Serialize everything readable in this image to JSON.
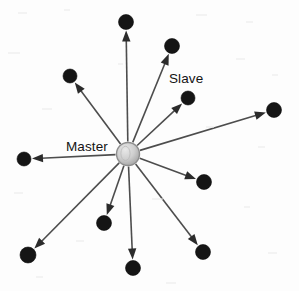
{
  "figure": {
    "name": "master-slave-star-topology",
    "width": 299,
    "height": 291,
    "background_color": "#fdfdfd"
  },
  "labels": {
    "master": "Master",
    "slave": "Slave"
  },
  "colors": {
    "edge": "#4d4d4d",
    "arrow_head": "#2b2b2b",
    "slave_fill": "#151515",
    "master_fill_light": "#dcdcdc",
    "master_fill_dark": "#a8a8a8",
    "master_stroke": "#8d8d8d",
    "label_text": "#141414"
  },
  "master_node": {
    "id": "master",
    "label": "Master",
    "cx": 128,
    "cy": 154,
    "r": 11.5
  },
  "label_positions": {
    "master": {
      "x": 66,
      "y": 151,
      "anchor": "start"
    },
    "slave": {
      "x": 169,
      "y": 83,
      "anchor": "start"
    }
  },
  "slave_nodes": [
    {
      "id": "slave-1",
      "cx": 126,
      "cy": 22,
      "r": 7.5,
      "angle_deg": 269
    },
    {
      "id": "slave-2",
      "cx": 172,
      "cy": 46,
      "r": 7.5,
      "angle_deg": 295
    },
    {
      "id": "slave-3",
      "cx": 70,
      "cy": 76,
      "r": 7.0,
      "angle_deg": 217
    },
    {
      "id": "slave-4",
      "cx": 188,
      "cy": 98,
      "r": 7.0,
      "angle_deg": 318
    },
    {
      "id": "slave-5",
      "cx": 274,
      "cy": 110,
      "r": 7.5,
      "angle_deg": 345
    },
    {
      "id": "slave-6",
      "cx": 24,
      "cy": 159,
      "r": 7.0,
      "angle_deg": 182
    },
    {
      "id": "slave-7",
      "cx": 204,
      "cy": 182,
      "r": 7.5,
      "angle_deg": 20
    },
    {
      "id": "slave-8",
      "cx": 104,
      "cy": 223,
      "r": 7.5,
      "angle_deg": 108
    },
    {
      "id": "slave-9",
      "cx": 28,
      "cy": 255,
      "r": 8.0,
      "angle_deg": 134
    },
    {
      "id": "slave-10",
      "cx": 133,
      "cy": 268,
      "r": 7.5,
      "angle_deg": 92
    },
    {
      "id": "slave-11",
      "cx": 203,
      "cy": 252,
      "r": 7.5,
      "angle_deg": 52
    }
  ],
  "edges": [
    {
      "from": "master",
      "to": "slave-1",
      "directed": true
    },
    {
      "from": "master",
      "to": "slave-2",
      "directed": true
    },
    {
      "from": "master",
      "to": "slave-3",
      "directed": true
    },
    {
      "from": "master",
      "to": "slave-4",
      "directed": true
    },
    {
      "from": "master",
      "to": "slave-5",
      "directed": true
    },
    {
      "from": "master",
      "to": "slave-6",
      "directed": true
    },
    {
      "from": "master",
      "to": "slave-7",
      "directed": true
    },
    {
      "from": "master",
      "to": "slave-8",
      "directed": true
    },
    {
      "from": "master",
      "to": "slave-9",
      "directed": true
    },
    {
      "from": "master",
      "to": "slave-10",
      "directed": true
    },
    {
      "from": "master",
      "to": "slave-11",
      "directed": true
    }
  ],
  "geometry": {
    "arrow_length": 11,
    "arrow_half_width": 4.2,
    "edge_stroke_width": 1.6,
    "gap_before_node": 1.0,
    "gap_after_hub": 1.0
  },
  "scan_specks": [
    {
      "x": 18,
      "y": 12,
      "w": 9,
      "h": 2
    },
    {
      "x": 64,
      "y": 9,
      "w": 6,
      "h": 2
    },
    {
      "x": 196,
      "y": 14,
      "w": 11,
      "h": 2
    },
    {
      "x": 246,
      "y": 21,
      "w": 7,
      "h": 2
    },
    {
      "x": 8,
      "y": 52,
      "w": 12,
      "h": 2
    },
    {
      "x": 118,
      "y": 63,
      "w": 5,
      "h": 2
    },
    {
      "x": 236,
      "y": 58,
      "w": 9,
      "h": 2
    },
    {
      "x": 272,
      "y": 74,
      "w": 6,
      "h": 2
    },
    {
      "x": 42,
      "y": 108,
      "w": 10,
      "h": 2
    },
    {
      "x": 206,
      "y": 126,
      "w": 8,
      "h": 2
    },
    {
      "x": 258,
      "y": 146,
      "w": 7,
      "h": 2
    },
    {
      "x": 14,
      "y": 192,
      "w": 9,
      "h": 2
    },
    {
      "x": 152,
      "y": 198,
      "w": 11,
      "h": 2
    },
    {
      "x": 244,
      "y": 206,
      "w": 6,
      "h": 2
    },
    {
      "x": 76,
      "y": 240,
      "w": 8,
      "h": 2
    },
    {
      "x": 268,
      "y": 252,
      "w": 9,
      "h": 2
    },
    {
      "x": 36,
      "y": 276,
      "w": 7,
      "h": 2
    },
    {
      "x": 166,
      "y": 282,
      "w": 10,
      "h": 2
    }
  ]
}
